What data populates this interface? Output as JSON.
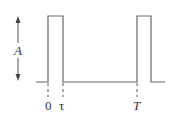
{
  "diagram": {
    "type": "pulse-train",
    "amplitude_label": "A",
    "labels": {
      "start": "0",
      "width": "τ",
      "period": "T"
    },
    "colors": {
      "line": "#555555",
      "dash": "#555555",
      "text": "#333333"
    }
  }
}
